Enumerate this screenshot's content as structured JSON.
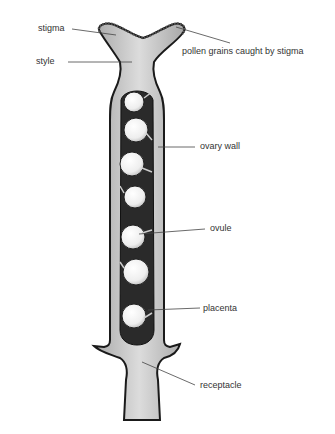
{
  "diagram": {
    "labels": {
      "stigma": "stigma",
      "style": "style",
      "pollen": "pollen grains caught by stigma",
      "ovary_wall": "ovary wall",
      "ovule": "ovule",
      "placenta": "placenta",
      "receptacle": "receptacle"
    },
    "colors": {
      "background": "#ffffff",
      "tissue_light": "#d4d4d4",
      "tissue_mid": "#b8b8b8",
      "ovary_cavity": "#2a2a2a",
      "ovule": "#f0f0f0",
      "outline": "#1a1a1a",
      "leader_line": "#444444"
    },
    "ovule_count": 7
  }
}
